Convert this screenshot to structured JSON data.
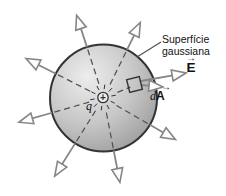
{
  "figure": {
    "surface_label": "Superfície\ngaussiana",
    "e_label": "E",
    "area_d": "d",
    "area_A": "A",
    "charge_label": "q",
    "plus_sign": "+",
    "vector_arrow": "→"
  },
  "colors": {
    "background": "#ffffff",
    "sphere_light": "#ededed",
    "sphere_mid": "#c7c7c7",
    "sphere_dark": "#9c9c9c",
    "outline": "#333333",
    "line": "#868686",
    "dash": "#4f4f4f",
    "arrow_fill": "#fdfdfd",
    "text": "#111111"
  },
  "diagram": {
    "width": 226,
    "height": 196,
    "sphere": {
      "cx": 103.5,
      "cy": 98,
      "r": 53.5
    },
    "rays": [
      {
        "angle": 64,
        "tip": 84
      },
      {
        "angle": 108,
        "tip": 87
      },
      {
        "angle": 153,
        "tip": 87
      },
      {
        "angle": 196,
        "tip": 88
      },
      {
        "angle": 238,
        "tip": 92
      },
      {
        "angle": 281,
        "tip": 86
      },
      {
        "angle": 330,
        "tip": 83
      }
    ],
    "dash_inner_r": 15,
    "dash_to_square": {
      "angle": 22,
      "from": 15,
      "to": 29
    },
    "arrow_head": {
      "len": 14,
      "half_w": 5.5
    },
    "area_square": {
      "cx": 134.5,
      "cy": 84.5,
      "size": 13,
      "tilt": -14
    },
    "e_arrow": {
      "x1": 141,
      "y1": 81,
      "x2": 186,
      "y2": 73
    },
    "da_arrow": {
      "x1": 141,
      "y1": 85,
      "x2": 163,
      "y2": 87
    },
    "leader_line": {
      "x1": 161,
      "y1": 42,
      "x2": 137,
      "y2": 57
    },
    "charge": {
      "cx": 103,
      "cy": 97.5,
      "r": 5.2,
      "burst_r1": 8.5,
      "burst_r2": 13,
      "burst_count": 10
    }
  }
}
